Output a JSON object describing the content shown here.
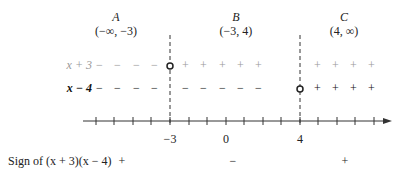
{
  "regions": [
    {
      "letter": "A",
      "interval": "(−∞, −3)",
      "cx": 116
    },
    {
      "letter": "B",
      "interval": "(−3, 4)",
      "cx": 236
    },
    {
      "letter": "C",
      "interval": "(4, ∞)",
      "cx": 344
    }
  ],
  "rows": [
    {
      "label": "x + 3",
      "color": "#999999",
      "y": 66,
      "signs_left": [
        "−",
        "−",
        "−",
        "−"
      ],
      "signs_mid": [
        "+",
        "+",
        "+",
        "+",
        "+"
      ],
      "signs_right": [
        "+",
        "+",
        "+",
        "+"
      ]
    },
    {
      "label": "x − 4",
      "color": "#111111",
      "y": 90,
      "signs_left": [
        "−",
        "−",
        "−",
        "−"
      ],
      "signs_mid": [
        "−",
        "−",
        "−",
        "−",
        "−"
      ],
      "signs_right": [
        "+",
        "+",
        "+",
        "+"
      ]
    }
  ],
  "axis": {
    "tick_labels": [
      {
        "text": "−3",
        "value": -3
      },
      {
        "text": "0",
        "value": 0
      },
      {
        "text": "4",
        "value": 4
      }
    ],
    "critical_points": [
      -3,
      4
    ]
  },
  "sign_row": {
    "label": "Sign of (x + 3)(x − 4)",
    "signs": [
      "+",
      "−",
      "+"
    ]
  }
}
